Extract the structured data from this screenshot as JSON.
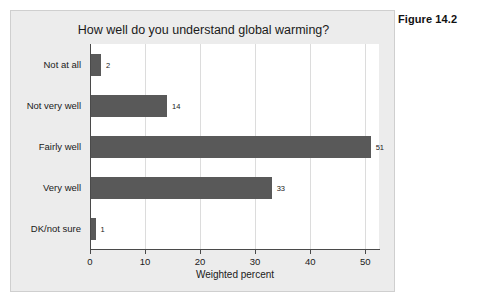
{
  "figure": {
    "label": "Figure 14.2"
  },
  "chart_data": {
    "type": "bar",
    "orientation": "horizontal",
    "title": "How well do you understand global warming?",
    "xlabel": "Weighted percent",
    "ylabel": "",
    "categories": [
      "Not at all",
      "Not very well",
      "Fairly well",
      "Very well",
      "DK/not sure"
    ],
    "values": [
      2,
      14,
      51,
      33,
      1
    ],
    "value_labels": [
      "2",
      "14",
      "51",
      "33",
      "1"
    ],
    "xticks": [
      0,
      10,
      20,
      30,
      40,
      50
    ],
    "xtick_labels": [
      "0",
      "10",
      "20",
      "30",
      "40",
      "50"
    ],
    "xlim": [
      0,
      52.5
    ],
    "grid": "vertical",
    "legend": "none",
    "bar_color": "#595959",
    "plot_background": "#ffffff",
    "panel_background": "#ececec"
  }
}
